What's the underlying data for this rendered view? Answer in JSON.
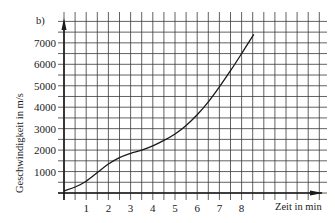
{
  "figure_label": "b)",
  "chart_data": {
    "type": "line",
    "title": "",
    "panel_label": "b)",
    "xlabel": "Zeit in min",
    "ylabel": "Geschwindigkeit in m/s",
    "x_ticks": [
      "1",
      "2",
      "3",
      "4",
      "5",
      "6",
      "7",
      "8"
    ],
    "y_ticks": [
      "1000",
      "2000",
      "3000",
      "4000",
      "5000",
      "6000",
      "7000"
    ],
    "xlim": [
      0,
      8.7
    ],
    "ylim": [
      0,
      7700
    ],
    "grid": true,
    "grid_step_x": 0.5,
    "grid_step_y": 500,
    "legend": null,
    "series": [
      {
        "name": "Geschwindigkeit",
        "x": [
          0,
          0.5,
          1,
          1.5,
          2,
          2.5,
          3,
          3.5,
          4,
          4.5,
          5,
          5.5,
          6,
          6.5,
          7,
          7.5,
          8,
          8.55
        ],
        "values": [
          100,
          280,
          550,
          950,
          1350,
          1650,
          1850,
          2000,
          2200,
          2450,
          2750,
          3150,
          3650,
          4250,
          4950,
          5700,
          6500,
          7400
        ]
      }
    ]
  },
  "colors": {
    "ink": "#1a1a1a",
    "grid": "#3a3a3a",
    "background": "#ffffff"
  }
}
